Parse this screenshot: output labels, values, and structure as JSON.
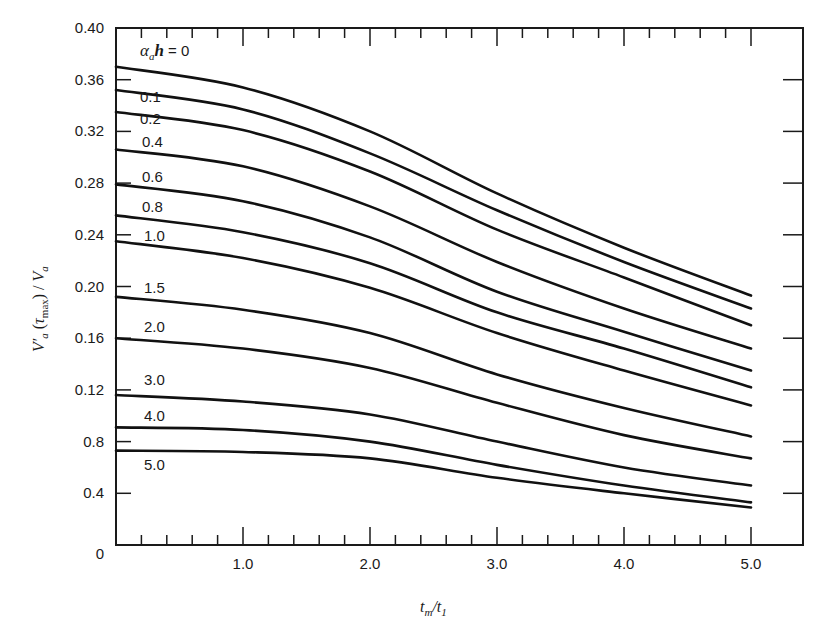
{
  "chart_data": {
    "type": "line",
    "title": "",
    "xlabel": "t_m/t_1",
    "ylabel": "V'_a(τ_max)/V_a",
    "xlim": [
      0,
      5.5
    ],
    "ylim": [
      0,
      0.4
    ],
    "grid": false,
    "legend": "inline curve labels",
    "x_ticks": [
      {
        "value": 1.0,
        "label": "1.0"
      },
      {
        "value": 2.0,
        "label": "2.0"
      },
      {
        "value": 3.0,
        "label": "3.0"
      },
      {
        "value": 4.0,
        "label": "4.0"
      },
      {
        "value": 5.0,
        "label": "5.0"
      }
    ],
    "y_ticks": [
      {
        "value": 0.4,
        "label": "0.40"
      },
      {
        "value": 0.36,
        "label": "0.36"
      },
      {
        "value": 0.32,
        "label": "0.32"
      },
      {
        "value": 0.28,
        "label": "0.28"
      },
      {
        "value": 0.24,
        "label": "0.24"
      },
      {
        "value": 0.2,
        "label": "0.20"
      },
      {
        "value": 0.16,
        "label": "0.16"
      },
      {
        "value": 0.12,
        "label": "0.12"
      },
      {
        "value": 0.08,
        "label": "0.8"
      },
      {
        "value": 0.04,
        "label": "0.4"
      },
      {
        "value": 0.0,
        "label": "0"
      }
    ],
    "parameter_label": "α_a h = 0",
    "x": [
      0,
      1.0,
      2.0,
      3.0,
      4.0,
      5.0
    ],
    "series": [
      {
        "name": "0",
        "label": "α_a h = 0",
        "values": [
          0.37,
          0.354,
          0.32,
          0.272,
          0.23,
          0.193
        ]
      },
      {
        "name": "0.1",
        "label": "0.1",
        "values": [
          0.352,
          0.337,
          0.303,
          0.259,
          0.219,
          0.183
        ]
      },
      {
        "name": "0.2",
        "label": "0.2",
        "values": [
          0.335,
          0.321,
          0.289,
          0.244,
          0.207,
          0.17
        ]
      },
      {
        "name": "0.4",
        "label": "0.4",
        "values": [
          0.306,
          0.293,
          0.262,
          0.219,
          0.183,
          0.152
        ]
      },
      {
        "name": "0.6",
        "label": "0.6",
        "values": [
          0.279,
          0.266,
          0.238,
          0.196,
          0.165,
          0.135
        ]
      },
      {
        "name": "0.8",
        "label": "0.8",
        "values": [
          0.255,
          0.242,
          0.218,
          0.18,
          0.152,
          0.122
        ]
      },
      {
        "name": "1.0",
        "label": "1.0",
        "values": [
          0.235,
          0.222,
          0.199,
          0.164,
          0.135,
          0.108
        ]
      },
      {
        "name": "1.5",
        "label": "1.5",
        "values": [
          0.192,
          0.182,
          0.164,
          0.132,
          0.106,
          0.084
        ]
      },
      {
        "name": "2.0",
        "label": "2.0",
        "values": [
          0.16,
          0.152,
          0.137,
          0.11,
          0.085,
          0.067
        ]
      },
      {
        "name": "3.0",
        "label": "3.0",
        "values": [
          0.116,
          0.111,
          0.101,
          0.08,
          0.06,
          0.046
        ]
      },
      {
        "name": "4.0",
        "label": "4.0",
        "values": [
          0.091,
          0.089,
          0.08,
          0.062,
          0.046,
          0.033
        ]
      },
      {
        "name": "5.0",
        "label": "5.0",
        "values": [
          0.073,
          0.072,
          0.067,
          0.052,
          0.04,
          0.029
        ]
      }
    ]
  },
  "labels": {
    "x_axis_title": "t_m/t_1",
    "y_axis_title": "V'_a(τ_max)/V_a",
    "alpha_label": "α_a h = 0"
  }
}
